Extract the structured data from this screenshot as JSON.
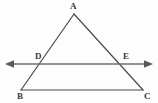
{
  "figure": {
    "width": 158,
    "height": 103,
    "background_color": "#fdfdfd",
    "triangle_stroke_color": "#4a4a4a",
    "transversal_stroke_color": "#6f6f6f",
    "label_color": "#3b3b3b"
  },
  "labels": {
    "apex": "A",
    "bottom_left": "B",
    "bottom_right": "C",
    "left_intersection": "D",
    "right_intersection": "E"
  },
  "label_positions": {
    "apex": {
      "x": 70,
      "y": 2
    },
    "bottom_left": {
      "x": 17,
      "y": 92
    },
    "bottom_right": {
      "x": 144,
      "y": 92
    },
    "left_intersection": {
      "x": 35,
      "y": 52
    },
    "right_intersection": {
      "x": 123,
      "y": 52
    }
  },
  "geometry": {
    "points": {
      "A": {
        "x": 74,
        "y": 14
      },
      "B": {
        "x": 21,
        "y": 90
      },
      "C": {
        "x": 143,
        "y": 90
      },
      "D": {
        "x": 42.3,
        "y": 64
      },
      "E": {
        "x": 119.3,
        "y": 64
      }
    },
    "transversal": {
      "left_end": {
        "x": 6,
        "y": 64
      },
      "right_end": {
        "x": 152,
        "y": 64
      },
      "arrowheads": "both"
    },
    "segments": [
      {
        "name": "side-AB",
        "from": "A",
        "to": "B"
      },
      {
        "name": "side-AC",
        "from": "A",
        "to": "C"
      },
      {
        "name": "base-BC",
        "from": "B",
        "to": "C"
      },
      {
        "name": "transversal-DE",
        "from": "left_end",
        "to": "right_end"
      }
    ]
  }
}
